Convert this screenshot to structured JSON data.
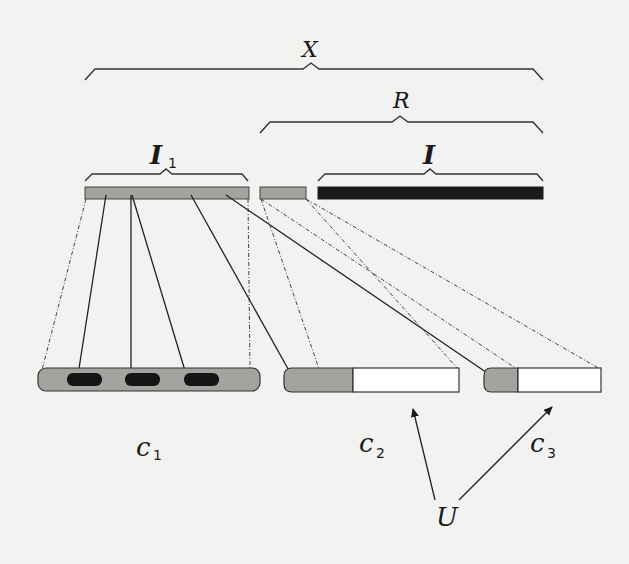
{
  "diagram": {
    "title": "",
    "colors": {
      "background": "#f2f2f0",
      "gray_fill": "#a3a3a0",
      "dark_fill": "#1a1a1a",
      "white_fill": "#ffffff",
      "stroke": "#2a2a2a"
    },
    "braces": [
      {
        "id": "X",
        "label": "X",
        "subscript": ""
      },
      {
        "id": "R",
        "label": "R",
        "subscript": ""
      },
      {
        "id": "I1",
        "label": "I",
        "subscript": "1"
      },
      {
        "id": "I",
        "label": "I",
        "subscript": ""
      }
    ],
    "top_bars": [
      {
        "id": "I1-bar",
        "fill": "gray"
      },
      {
        "id": "gap-bar",
        "fill": "gray"
      },
      {
        "id": "I-bar",
        "fill": "black"
      }
    ],
    "cells": [
      {
        "id": "c1",
        "label": "c",
        "subscript": "1",
        "inner_blocks": 3
      },
      {
        "id": "c2",
        "label": "c",
        "subscript": "2"
      },
      {
        "id": "c3",
        "label": "c",
        "subscript": "3"
      }
    ],
    "pointer": {
      "label": "U",
      "targets": [
        "c2",
        "c3"
      ]
    }
  }
}
